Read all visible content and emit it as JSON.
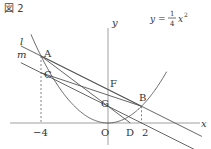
{
  "figure_label": "図 2",
  "curve": {
    "label_prefix": "y = ",
    "num": "1",
    "den": "4",
    "label_suffix": "x",
    "exp": "2",
    "a": 0.25
  },
  "axes": {
    "x_label": "x",
    "y_label": "y",
    "origin_label": "O",
    "ticks": [
      {
        "value": -4,
        "label": "−4"
      },
      {
        "value": 2,
        "label": "2"
      }
    ]
  },
  "points": {
    "A": {
      "label": "A",
      "x": -4,
      "y": 4
    },
    "B": {
      "label": "B",
      "x": 2,
      "y": 1
    },
    "C": {
      "label": "C",
      "x": -4,
      "y": 3
    },
    "F": {
      "label": "F",
      "x": 0,
      "y": 2
    },
    "G": {
      "label": "G",
      "x": 0,
      "y": 1
    },
    "D": {
      "label": "D",
      "x": 1.3333,
      "y": 0
    }
  },
  "lines": {
    "l": {
      "label": "l",
      "slope": -0.5,
      "intercept": 2
    },
    "m": {
      "label": "m",
      "slope": -0.5,
      "intercept": 1
    }
  },
  "segments": [
    [
      "A",
      "D"
    ],
    [
      "C",
      "B"
    ],
    [
      "A",
      "B"
    ]
  ]
}
